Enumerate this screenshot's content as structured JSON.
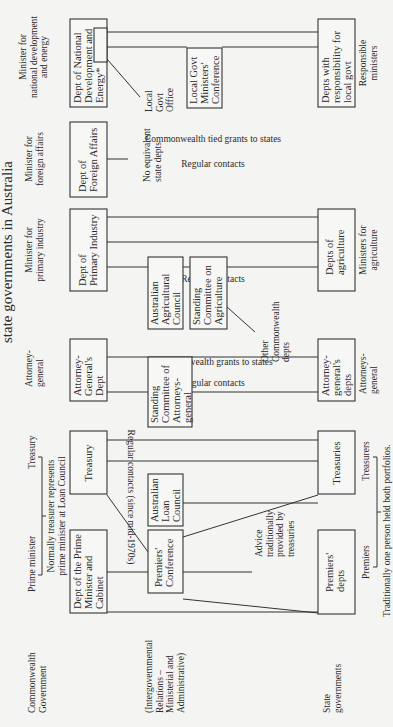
{
  "diagram": {
    "title": "state governments in Australia",
    "row_labels": {
      "commonwealth": [
        "Commonwealth",
        "Government"
      ],
      "intergovernmental": [
        "(Intergovernmental",
        "Relations –",
        "Ministerial and",
        "Administrative)"
      ],
      "state": [
        "State",
        "governments"
      ]
    },
    "commonwealth_ministers": {
      "prime_minister": [
        "Prime minister"
      ],
      "treasury": [
        "Treasury"
      ],
      "pm_treasury_note": [
        "Normally treasurer represents",
        "prime minister at Loan Council"
      ],
      "attorney_general": [
        "Attorney-",
        "general"
      ],
      "primary_industry": [
        "Minister for",
        "primary industry"
      ],
      "foreign_affairs": [
        "Minister for",
        "foreign affairs"
      ],
      "national_development": [
        "Minister for",
        "national development",
        "and energy"
      ]
    },
    "commonwealth_depts": {
      "pm_cabinet": [
        "Dept of the Prime",
        "Minister and",
        "Cabinet"
      ],
      "treasury": [
        "Treasury"
      ],
      "attorney_general": [
        "Attorney-",
        "General's",
        "Dept"
      ],
      "primary_industry": [
        "Dept of",
        "Primary Industry"
      ],
      "foreign_affairs": [
        "Dept of",
        "Foreign Affairs"
      ],
      "national_development": [
        "Dept of National",
        "Development and",
        "Energy*"
      ]
    },
    "intergovernmental_bodies": {
      "premiers_conference": [
        "Premiers'",
        "Conference"
      ],
      "loan_council": [
        "Australian",
        "Loan",
        "Council"
      ],
      "sc_attorneys": [
        "Standing",
        "Committee of",
        "Attorneys-",
        "general"
      ],
      "agricultural_council": [
        "Australian",
        "Agricultural",
        "Council"
      ],
      "sc_agriculture": [
        "Standing",
        "Committee on",
        "Agriculture"
      ],
      "local_govt_conference": [
        "Local Govt",
        "Ministers'",
        "Conference"
      ]
    },
    "annotations": {
      "advice": [
        "Advice",
        "traditionally",
        "provided by",
        "treasuries"
      ],
      "other_depts": [
        "Other",
        "Commonwealth",
        "depts"
      ],
      "no_equivalent": [
        "No equivalent",
        "state depts"
      ],
      "local_govt_office": [
        "Local",
        "Govt",
        "Office"
      ],
      "regular_contacts": "Regular contacts",
      "regular_contacts_since": "Regular contacts (since mid-1970s)",
      "grants": "Commonwealth grants to states",
      "tied_grants": "Commonwealth tied grants to states"
    },
    "state_depts": {
      "premiers": [
        "Premiers'",
        "depts"
      ],
      "treasuries": [
        "Treasuries"
      ],
      "attorney_general": [
        "Attorney-",
        "general's",
        "depts"
      ],
      "agriculture": [
        "Depts of",
        "agriculture"
      ],
      "local_govt": [
        "Depts with",
        "responsibility for",
        "local govt"
      ]
    },
    "state_ministers": {
      "premiers": [
        "Premiers"
      ],
      "treasurers": [
        "Treasurers"
      ],
      "attorneys": [
        "Attorneys-",
        "general"
      ],
      "agriculture": [
        "Ministers for",
        "agriculture"
      ],
      "responsible": [
        "Responsible",
        "ministers"
      ]
    },
    "footnote": "Traditionally one person held both portfolios."
  }
}
